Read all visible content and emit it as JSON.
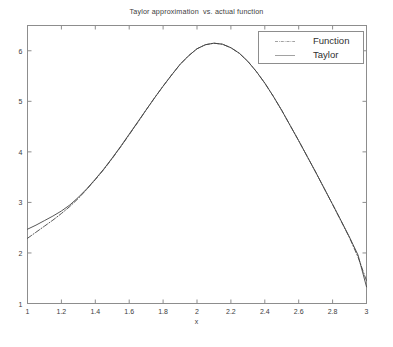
{
  "chart_data": {
    "type": "line",
    "title": "Taylor approximation  vs. actual function",
    "xlabel": "x",
    "ylabel": "",
    "xlim": [
      1,
      3
    ],
    "ylim": [
      1,
      6.5
    ],
    "grid": false,
    "legend_position": "top-right",
    "xticks": [
      "1",
      "1.2",
      "1.4",
      "1.6",
      "1.8",
      "2",
      "2.2",
      "2.4",
      "2.6",
      "2.8",
      "3"
    ],
    "xtick_values": [
      1,
      1.2,
      1.4,
      1.6,
      1.8,
      2,
      2.2,
      2.4,
      2.6,
      2.8,
      3
    ],
    "yticks": [
      "1",
      "2",
      "3",
      "4",
      "5",
      "6"
    ],
    "ytick_values": [
      1,
      2,
      3,
      4,
      5,
      6
    ],
    "series": [
      {
        "name": "Function",
        "style": "dash-dot",
        "color": "#444444",
        "x": [
          1.0,
          1.05,
          1.1,
          1.15,
          1.2,
          1.25,
          1.3,
          1.35,
          1.4,
          1.45,
          1.5,
          1.55,
          1.6,
          1.65,
          1.7,
          1.75,
          1.8,
          1.85,
          1.9,
          1.95,
          2.0,
          2.05,
          2.1,
          2.15,
          2.2,
          2.25,
          2.3,
          2.35,
          2.4,
          2.45,
          2.5,
          2.55,
          2.6,
          2.65,
          2.7,
          2.75,
          2.8,
          2.85,
          2.9,
          2.95,
          3.0
        ],
        "y": [
          2.29,
          2.41,
          2.53,
          2.65,
          2.78,
          2.92,
          3.08,
          3.26,
          3.45,
          3.65,
          3.87,
          4.1,
          4.34,
          4.58,
          4.83,
          5.07,
          5.3,
          5.52,
          5.73,
          5.9,
          6.04,
          6.12,
          6.15,
          6.13,
          6.06,
          5.95,
          5.79,
          5.59,
          5.36,
          5.1,
          4.82,
          4.52,
          4.22,
          3.91,
          3.6,
          3.28,
          2.96,
          2.63,
          2.3,
          1.92,
          1.45
        ]
      },
      {
        "name": "Taylor",
        "style": "solid",
        "color": "#444444",
        "x": [
          1.0,
          1.05,
          1.1,
          1.15,
          1.2,
          1.25,
          1.3,
          1.35,
          1.4,
          1.45,
          1.5,
          1.55,
          1.6,
          1.65,
          1.7,
          1.75,
          1.8,
          1.85,
          1.9,
          1.95,
          2.0,
          2.05,
          2.1,
          2.15,
          2.2,
          2.25,
          2.3,
          2.35,
          2.4,
          2.45,
          2.5,
          2.55,
          2.6,
          2.65,
          2.7,
          2.75,
          2.8,
          2.85,
          2.9,
          2.95,
          3.0
        ],
        "y": [
          2.47,
          2.55,
          2.64,
          2.73,
          2.83,
          2.95,
          3.1,
          3.27,
          3.46,
          3.66,
          3.88,
          4.11,
          4.35,
          4.59,
          4.83,
          5.07,
          5.3,
          5.52,
          5.73,
          5.9,
          6.04,
          6.12,
          6.15,
          6.13,
          6.06,
          5.95,
          5.79,
          5.59,
          5.36,
          5.1,
          4.82,
          4.52,
          4.22,
          3.91,
          3.6,
          3.28,
          2.96,
          2.64,
          2.31,
          1.96,
          1.33
        ]
      }
    ],
    "annotations": {
      "peak_x": 2.03,
      "peak_y": 6.15,
      "left_endpoint_function": 2.29,
      "left_endpoint_taylor": 2.47,
      "right_endpoint_function": 1.45,
      "right_endpoint_taylor": 1.33
    }
  },
  "legend": {
    "entries": [
      {
        "label": "Function"
      },
      {
        "label": "Taylor"
      }
    ]
  },
  "axes": {
    "box_color": "#8d8d8d",
    "line_color": "#444444",
    "background": "#ffffff"
  }
}
